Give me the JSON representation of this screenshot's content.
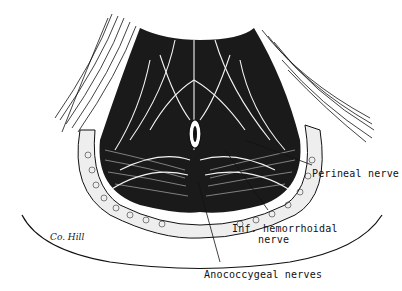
{
  "figure": {
    "labels": {
      "perineal": "Perineal nerve",
      "inf_hemorrhoidal_line1": "Inf. hemorrhoidal",
      "inf_hemorrhoidal_line2": "nerve",
      "anococcygeal": "Anococcygeal nerves"
    },
    "signature": "Co. Hill",
    "colors": {
      "ink": "#111111",
      "paper": "#ffffff",
      "fat": "#e8e8e8"
    }
  }
}
